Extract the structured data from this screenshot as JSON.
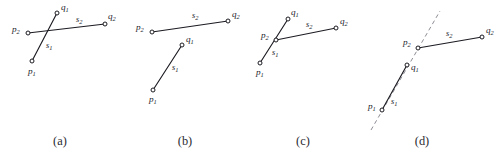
{
  "figure": {
    "background_color": "#ffffff",
    "line_color": "#1b1b22",
    "dashed_line_color": "#8d8d96",
    "marker_fill": "#ffffff",
    "panels": [
      {
        "caption": "(a)",
        "caption_pos": {
          "x": 60,
          "y": 145
        },
        "segments": [
          {
            "name": "s1",
            "label": "s",
            "sub": "1",
            "label_pos": {
              "x": 46,
              "y": 48
            },
            "style": "solid",
            "from": {
              "x": 32,
              "y": 61
            },
            "to": {
              "x": 57,
              "y": 13
            }
          },
          {
            "name": "s2",
            "label": "s",
            "sub": "2",
            "label_pos": {
              "x": 76,
              "y": 22
            },
            "style": "solid",
            "from": {
              "x": 28,
              "y": 33
            },
            "to": {
              "x": 105,
              "y": 24
            }
          }
        ],
        "points": [
          {
            "name": "p1",
            "label": "p",
            "sub": "1",
            "x": 32,
            "y": 61,
            "label_x": 28,
            "label_y": 74
          },
          {
            "name": "q1",
            "label": "q",
            "sub": "1",
            "x": 57,
            "y": 13,
            "label_x": 61,
            "label_y": 10
          },
          {
            "name": "p2",
            "label": "p",
            "sub": "2",
            "x": 28,
            "y": 33,
            "label_x": 12,
            "label_y": 32
          },
          {
            "name": "q2",
            "label": "q",
            "sub": "2",
            "x": 105,
            "y": 24,
            "label_x": 108,
            "label_y": 19
          }
        ],
        "dashed": []
      },
      {
        "caption": "(b)",
        "caption_pos": {
          "x": 185,
          "y": 145
        },
        "segments": [
          {
            "name": "s1",
            "label": "s",
            "sub": "1",
            "label_pos": {
              "x": 172,
              "y": 70
            },
            "style": "solid",
            "from": {
              "x": 153,
              "y": 90
            },
            "to": {
              "x": 182,
              "y": 45
            }
          },
          {
            "name": "s2",
            "label": "s",
            "sub": "2",
            "label_pos": {
              "x": 192,
              "y": 18
            },
            "style": "solid",
            "from": {
              "x": 152,
              "y": 32
            },
            "to": {
              "x": 228,
              "y": 21
            }
          }
        ],
        "points": [
          {
            "name": "p1",
            "label": "p",
            "sub": "1",
            "x": 153,
            "y": 90,
            "label_x": 149,
            "label_y": 102
          },
          {
            "name": "q1",
            "label": "q",
            "sub": "1",
            "x": 182,
            "y": 45,
            "label_x": 186,
            "label_y": 42
          },
          {
            "name": "p2",
            "label": "p",
            "sub": "2",
            "x": 152,
            "y": 32,
            "label_x": 136,
            "label_y": 30
          },
          {
            "name": "q2",
            "label": "q",
            "sub": "2",
            "x": 228,
            "y": 21,
            "label_x": 232,
            "label_y": 17
          }
        ],
        "dashed": []
      },
      {
        "caption": "(c)",
        "caption_pos": {
          "x": 303,
          "y": 145
        },
        "segments": [
          {
            "name": "s1",
            "label": "s",
            "sub": "1",
            "label_pos": {
              "x": 272,
              "y": 55
            },
            "style": "solid",
            "from": {
              "x": 260,
              "y": 63
            },
            "to": {
              "x": 288,
              "y": 19
            }
          },
          {
            "name": "s2",
            "label": "s",
            "sub": "2",
            "label_pos": {
              "x": 306,
              "y": 27
            },
            "style": "solid",
            "from": {
              "x": 276,
              "y": 40
            },
            "to": {
              "x": 336,
              "y": 28
            }
          }
        ],
        "points": [
          {
            "name": "p1",
            "label": "p",
            "sub": "1",
            "x": 260,
            "y": 63,
            "label_x": 256,
            "label_y": 75
          },
          {
            "name": "q1",
            "label": "q",
            "sub": "1",
            "x": 288,
            "y": 19,
            "label_x": 291,
            "label_y": 15
          },
          {
            "name": "p2",
            "label": "p",
            "sub": "2",
            "x": 276,
            "y": 40,
            "label_x": 261,
            "label_y": 38
          },
          {
            "name": "q2",
            "label": "q",
            "sub": "2",
            "x": 336,
            "y": 28,
            "label_x": 340,
            "label_y": 24
          }
        ],
        "dashed": []
      },
      {
        "caption": "(d)",
        "caption_pos": {
          "x": 422,
          "y": 145
        },
        "segments": [
          {
            "name": "s1",
            "label": "s",
            "sub": "1",
            "label_pos": {
              "x": 391,
              "y": 104
            },
            "style": "solid",
            "from": {
              "x": 382,
              "y": 110
            },
            "to": {
              "x": 407,
              "y": 65
            }
          },
          {
            "name": "s2",
            "label": "s",
            "sub": "2",
            "label_pos": {
              "x": 446,
              "y": 36
            },
            "style": "solid",
            "from": {
              "x": 418,
              "y": 48
            },
            "to": {
              "x": 482,
              "y": 37
            }
          }
        ],
        "points": [
          {
            "name": "p1",
            "label": "p",
            "sub": "1",
            "x": 382,
            "y": 110,
            "label_x": 368,
            "label_y": 109
          },
          {
            "name": "q1",
            "label": "q",
            "sub": "1",
            "x": 407,
            "y": 65,
            "label_x": 411,
            "label_y": 70
          },
          {
            "name": "p2",
            "label": "p",
            "sub": "2",
            "x": 418,
            "y": 48,
            "label_x": 403,
            "label_y": 45
          },
          {
            "name": "q2",
            "label": "q",
            "sub": "2",
            "x": 482,
            "y": 37,
            "label_x": 486,
            "label_y": 33
          }
        ],
        "dashed": [
          {
            "name": "s1-extension",
            "from": {
              "x": 371,
              "y": 130
            },
            "to": {
              "x": 440,
              "y": 11
            }
          }
        ]
      }
    ]
  }
}
